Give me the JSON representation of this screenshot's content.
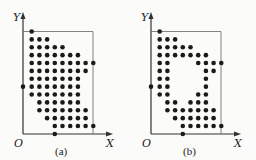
{
  "figure": {
    "grid": {
      "col0_x": 31.7,
      "col_spacing": 7.7,
      "row0_y": 31.5,
      "row_spacing": 7.875,
      "dot_radius": 2.3,
      "dot_color": "#1a1a1a",
      "line_color": "#333333"
    },
    "axes": {
      "origin_x": 23,
      "origin_y": 134,
      "y_top": 12,
      "x_right": 113,
      "box_right_x": 93,
      "box_top_y": 31.5
    },
    "panels": [
      {
        "id": "a",
        "caption": "(a)",
        "origin_label": "O",
        "x_label": "X",
        "y_label": "Y",
        "y_axis_dot_row": 7,
        "x_axis_dot_col": 3,
        "rows": [
          [
            0
          ],
          [
            0,
            1,
            2
          ],
          [
            0,
            1,
            2,
            3,
            4
          ],
          [
            0,
            1,
            2,
            3,
            4,
            5,
            6
          ],
          [
            0,
            1,
            2,
            3,
            4,
            5,
            6,
            7,
            8
          ],
          [
            0,
            1,
            2,
            3,
            4,
            5,
            6,
            7
          ],
          [
            0,
            1,
            2,
            3,
            4,
            5,
            6
          ],
          [
            0,
            1,
            2,
            3,
            4,
            5,
            6
          ],
          [
            0,
            1,
            2,
            3,
            4,
            5,
            6
          ],
          [
            1,
            2,
            3,
            4,
            5,
            6
          ],
          [
            1,
            2,
            3,
            4,
            5,
            6,
            7
          ],
          [
            2,
            3,
            4,
            5,
            6,
            7
          ],
          [
            3,
            4,
            5,
            6,
            7,
            8
          ]
        ]
      },
      {
        "id": "b",
        "caption": "(b)",
        "origin_label": "O",
        "x_label": "X",
        "y_label": "Y",
        "y_axis_dot_row": 7,
        "x_axis_dot_col": 3,
        "rows": [
          [
            0
          ],
          [
            0,
            1,
            2
          ],
          [
            0,
            1,
            2,
            3,
            4
          ],
          [
            0,
            1,
            2,
            3,
            4,
            5,
            6
          ],
          [
            0,
            1,
            5,
            6,
            7,
            8
          ],
          [
            0,
            1,
            6,
            7
          ],
          [
            0,
            1,
            6
          ],
          [
            0,
            1,
            6
          ],
          [
            0,
            1,
            5,
            6
          ],
          [
            1,
            2,
            4,
            5,
            6
          ],
          [
            1,
            2,
            3,
            4,
            5,
            6,
            7
          ],
          [
            2,
            3,
            4,
            5,
            6,
            7
          ],
          [
            3,
            4,
            5,
            6,
            7,
            8
          ]
        ]
      }
    ]
  }
}
